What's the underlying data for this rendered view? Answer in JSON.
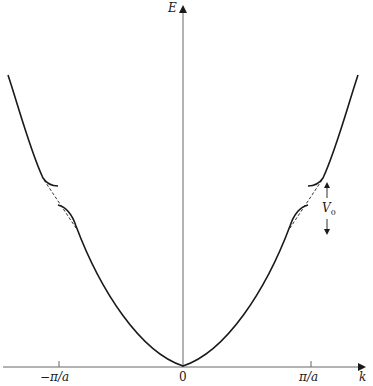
{
  "figure": {
    "type": "band-structure-diagram",
    "axes": {
      "x_label": "k",
      "y_label": "E",
      "x_ticks": [
        "−π/a",
        "0",
        "π/a"
      ]
    },
    "gap_label": "V",
    "gap_label_sub": "0",
    "colors": {
      "curve": "#1a1a1a",
      "axis": "#555555",
      "background": "#ffffff"
    }
  }
}
